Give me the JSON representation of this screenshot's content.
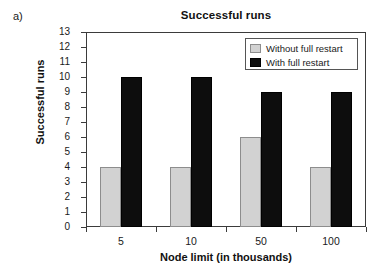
{
  "panel": {
    "label": "a)"
  },
  "chart_data": {
    "type": "bar",
    "title": "Successful runs",
    "xlabel": "Node limit (in thousands)",
    "ylabel": "Successful runs",
    "categories": [
      "5",
      "10",
      "50",
      "100"
    ],
    "series": [
      {
        "name": "Without full restart",
        "color": "#d2d2d2",
        "values": [
          4,
          4,
          6,
          4
        ]
      },
      {
        "name": "With full restart",
        "color": "#0d0d0d",
        "values": [
          10,
          10,
          9,
          9
        ]
      }
    ],
    "ylim": [
      0,
      13
    ],
    "yticks": [
      0,
      1,
      2,
      3,
      4,
      5,
      6,
      7,
      8,
      9,
      10,
      11,
      12,
      13
    ],
    "ytick_labels": [
      "0",
      "1",
      "2",
      "3",
      "4",
      "5",
      "6",
      "7",
      "8",
      "9",
      "10",
      "11",
      "12",
      "13"
    ],
    "grid": false,
    "legend_position": "top-right",
    "legend_entries": [
      "Without full restart",
      "With full restart"
    ]
  }
}
